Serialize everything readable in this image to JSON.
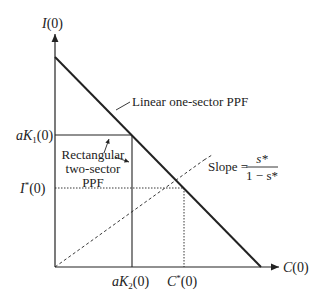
{
  "diagram": {
    "axes": {
      "y_label_var": "I",
      "y_label_arg": "(0)",
      "x_label_var": "C",
      "x_label_arg": "(0)"
    },
    "ticks": {
      "aK1": {
        "pre": "aK",
        "sub": "1",
        "post": "(0)"
      },
      "Istar": {
        "pre": "I",
        "sup": "*",
        "post": "(0)"
      },
      "aK2": {
        "pre": "aK",
        "sub": "2",
        "post": "(0)"
      },
      "Cstar": {
        "pre": "C",
        "sup": "*",
        "post": "(0)"
      }
    },
    "annotations": {
      "linear_ppf": "Linear one-sector PPF",
      "rect_line1": "Rectangular",
      "rect_line2": "two-sector",
      "rect_line3": "PPF",
      "slope_prefix": "Slope =",
      "slope_num": "s*",
      "slope_den": "1 − s*"
    },
    "colors": {
      "ink": "#222222",
      "background": "#ffffff"
    }
  }
}
